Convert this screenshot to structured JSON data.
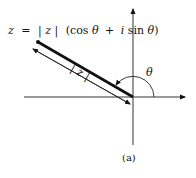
{
  "diagram": {
    "formula": {
      "lhs": "z",
      "eq": "=",
      "modulus": "| z |",
      "paren_open": "(cos",
      "theta1": "θ",
      "plus": "+",
      "i": "i",
      "sin": "sin",
      "theta2": "θ",
      "paren_close": ")"
    },
    "modulus_label": "| z |",
    "angle_label": "θ",
    "caption": "(a)",
    "colors": {
      "ink": "#111111",
      "axis": "#333333",
      "background": "#ffffff"
    }
  }
}
